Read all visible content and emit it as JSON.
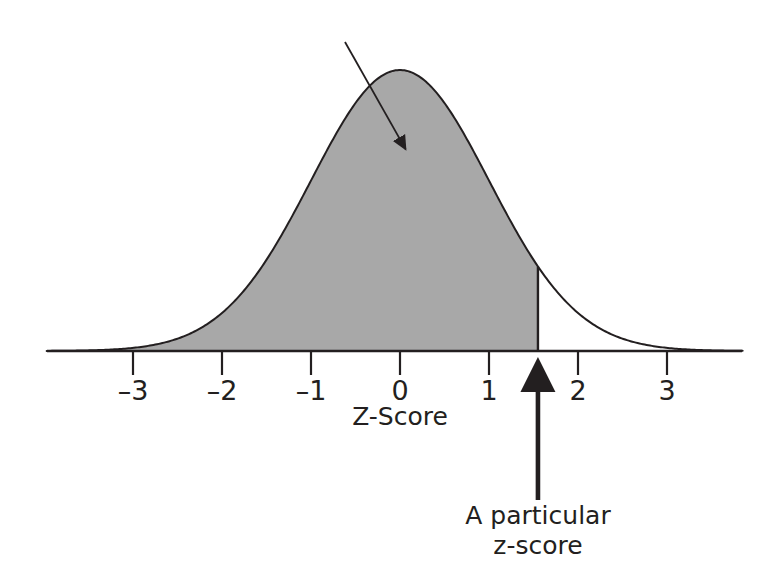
{
  "figure": {
    "name": "normal-distribution-z-score",
    "background_color": "#ffffff",
    "ink_color": "#231f20"
  },
  "chart_data": {
    "type": "area",
    "title": "",
    "subtitle": "",
    "xlabel": "Z-Score",
    "ylabel": "",
    "xlim": [
      -3.97,
      3.85
    ],
    "ylim": [
      0,
      1
    ],
    "grid": false,
    "legend": null,
    "curve": {
      "name": "standard-normal-density",
      "formula": "phi(z) = exp(-z^2 / 2)",
      "mean": 0,
      "sd": 1,
      "peak_z": 0,
      "peak_value": 1.0,
      "line_color": "#231f20",
      "line_width_px": 2
    },
    "x": [
      -4,
      -3.5,
      -3,
      -2.5,
      -2,
      -1.5,
      -1,
      -0.5,
      0,
      0.5,
      1,
      1.5,
      2,
      2.5,
      3,
      3.5,
      4
    ],
    "y": [
      0.0003,
      0.0022,
      0.0111,
      0.0439,
      0.1353,
      0.3247,
      0.6065,
      0.8825,
      1.0,
      0.8825,
      0.6065,
      0.3247,
      0.1353,
      0.0439,
      0.0111,
      0.0022,
      0.0003
    ],
    "shaded_region": {
      "name": "area-below-z",
      "from_z": -3.97,
      "to_z": 1.55,
      "fill_color": "#a8a8a8",
      "description": "Shaded area under the curve to the left of the particular z-score",
      "boundary_line_color": "#231f20"
    },
    "ticks": [
      {
        "z": -3,
        "label": "–3"
      },
      {
        "z": -2,
        "label": "–2"
      },
      {
        "z": -1,
        "label": "–1"
      },
      {
        "z": 0,
        "label": "0"
      },
      {
        "z": 1,
        "label": "1"
      },
      {
        "z": 2,
        "label": "2"
      },
      {
        "z": 3,
        "label": "3"
      }
    ],
    "annotations": [
      {
        "name": "area-pointer",
        "kind": "arrow",
        "text": "",
        "from": {
          "x_px": 345,
          "y_px": 42
        },
        "to": {
          "x_px": 410,
          "y_px": 157
        },
        "color": "#231f20",
        "points_at": "shaded area under the curve"
      },
      {
        "name": "z-score-pointer",
        "kind": "arrow",
        "text_line_1": "A particular",
        "text_line_2": "z-score",
        "from": {
          "x_px": 538,
          "y_px": 500
        },
        "to": {
          "x_px": 538,
          "y_px": 357
        },
        "color": "#231f20",
        "points_at": "the particular z-score on the axis",
        "z_value": 1.55
      }
    ]
  },
  "axis": {
    "label": "Z-Score",
    "label_x_px": 400,
    "label_y_px": 425,
    "baseline_y_px": 351,
    "baseline_x_start_px": 47,
    "baseline_x_end_px": 742,
    "origin_x_px": 400,
    "px_per_unit": 89,
    "tick_length_px": 24,
    "tick_label_y_px": 400
  },
  "callout": {
    "line_1": "A particular",
    "line_2": "z-score",
    "center_x_px": 538,
    "line_1_y_px": 524,
    "line_2_y_px": 554
  }
}
